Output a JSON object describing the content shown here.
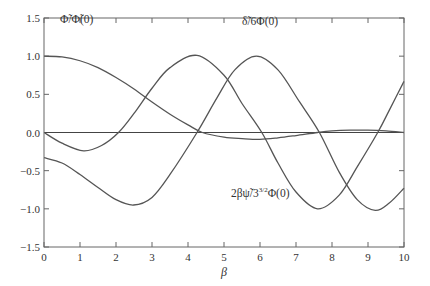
{
  "chart_data": {
    "type": "line",
    "title": "",
    "xlabel": "β",
    "ylabel": "",
    "xlim": [
      0,
      10
    ],
    "ylim": [
      -1.5,
      1.5
    ],
    "grid": false,
    "legend": "inline annotations",
    "x_ticks": [
      "0",
      "1",
      "2",
      "3",
      "4",
      "5",
      "6",
      "7",
      "8",
      "9",
      "10"
    ],
    "y_ticks": [
      "1.5",
      "1.0",
      "0.5",
      "0.0",
      "−0.5",
      "−1.0",
      "−1.5"
    ],
    "y_tick_values": [
      1.5,
      1.0,
      0.5,
      0.0,
      -0.5,
      -1.0,
      -1.5
    ],
    "horizontal_reference_line": 0.0,
    "series": [
      {
        "name": "Φ̃/Φ̃(0)",
        "x": [
          0,
          0.5,
          1,
          1.5,
          2,
          2.5,
          3,
          3.5,
          4,
          4.4,
          5,
          5.5,
          6,
          6.5,
          7,
          7.6,
          8,
          8.5,
          9,
          9.5,
          10
        ],
        "y": [
          1.0,
          0.99,
          0.94,
          0.85,
          0.72,
          0.57,
          0.4,
          0.24,
          0.1,
          0.0,
          -0.06,
          -0.08,
          -0.09,
          -0.07,
          -0.04,
          0.0,
          0.02,
          0.03,
          0.03,
          0.02,
          0.0
        ]
      },
      {
        "name": "δ̃/6Φ(0)",
        "x": [
          0,
          0.5,
          1.1,
          1.6,
          2.07,
          2.5,
          3,
          3.5,
          4.25,
          5,
          5.5,
          6.05,
          6.5,
          7,
          7.6,
          8.2,
          8.7,
          9.27,
          9.6,
          10
        ],
        "y": [
          0.0,
          -0.14,
          -0.24,
          -0.17,
          0.0,
          0.25,
          0.58,
          0.85,
          1.01,
          0.75,
          0.38,
          0.0,
          -0.4,
          -0.78,
          -1.0,
          -0.82,
          -0.45,
          0.0,
          0.3,
          0.67
        ]
      },
      {
        "name": "2βψ̃/3^{3/2}Φ(0)",
        "x": [
          0,
          0.5,
          1,
          1.5,
          2,
          2.49,
          3,
          3.5,
          4.25,
          4.8,
          5.3,
          5.9,
          6.5,
          7.1,
          7.65,
          8.2,
          8.7,
          9.2,
          9.6,
          10
        ],
        "y": [
          -0.33,
          -0.4,
          -0.55,
          -0.72,
          -0.88,
          -0.95,
          -0.85,
          -0.55,
          0.0,
          0.45,
          0.82,
          1.0,
          0.82,
          0.4,
          0.0,
          -0.52,
          -0.88,
          -1.02,
          -0.92,
          -0.73
        ]
      }
    ],
    "annotations": [
      {
        "text": "Φ̃/Φ̃(0)",
        "x": 0.2,
        "y": 1.15
      },
      {
        "text": "δ̃/6Φ(0)",
        "x": 5.3,
        "y": 1.12
      },
      {
        "text": "2βψ̃/3^{3/2}Φ(0)",
        "x": 4.2,
        "y": -0.8
      }
    ]
  },
  "labels": {
    "phi": "Φ̃/Φ̃(0)",
    "delta": "δ̃/6Φ(0)",
    "psi_main": "2βψ̃/3",
    "psi_sup": "3/2",
    "psi_tail": "Φ(0)",
    "xlabel": "β"
  }
}
